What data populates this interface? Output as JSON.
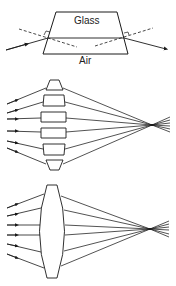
{
  "diagram": {
    "panels": [
      {
        "id": "prism-refraction",
        "labels": {
          "top": "Glass",
          "bottom": "Air"
        }
      },
      {
        "id": "stacked-prisms",
        "description": "six prism segments focusing parallel rays"
      },
      {
        "id": "convex-lens",
        "description": "biconvex lens focusing parallel rays"
      }
    ],
    "colors": {
      "line": "#1a1a1a",
      "background": "#ffffff"
    }
  }
}
